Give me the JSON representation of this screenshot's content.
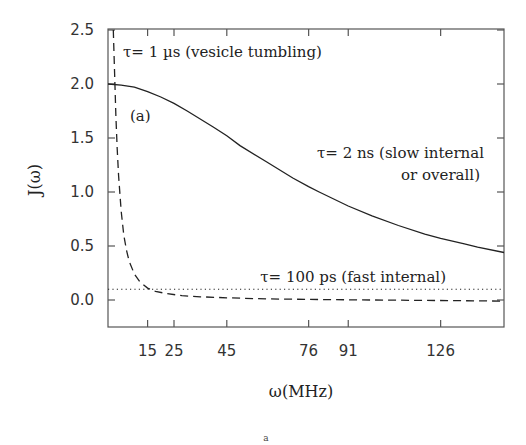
{
  "chart_data": {
    "type": "line",
    "title": "",
    "panel_label": "(a)",
    "caption": "a",
    "xlabel": "ω(MHz)",
    "ylabel": "J(ω)",
    "xlim": [
      0,
      150
    ],
    "ylim": [
      -0.25,
      2.5
    ],
    "grid": false,
    "x_ticks": [
      15,
      25,
      45,
      76,
      91,
      126
    ],
    "x_tick_labels": [
      "15",
      "25",
      "45",
      "76",
      "91",
      "126"
    ],
    "y_ticks": [
      0.0,
      0.5,
      1.0,
      1.5,
      2.0,
      2.5
    ],
    "y_tick_labels": [
      "0.0",
      "0.5",
      "1.0",
      "1.5",
      "2.0",
      "2.5"
    ],
    "series": [
      {
        "name": "τ= 2 ns (slow internal or overall)",
        "style": "solid",
        "x": [
          0,
          5,
          10,
          15,
          20,
          25,
          30,
          40,
          45,
          50,
          60,
          70,
          76,
          80,
          91,
          100,
          110,
          120,
          126,
          135,
          140,
          150
        ],
        "values": [
          2.0,
          1.99,
          1.97,
          1.93,
          1.88,
          1.82,
          1.75,
          1.6,
          1.52,
          1.43,
          1.28,
          1.13,
          1.05,
          1.0,
          0.87,
          0.78,
          0.69,
          0.61,
          0.57,
          0.52,
          0.49,
          0.44
        ]
      },
      {
        "name": "τ= 1 µs (vesicle tumbling)",
        "style": "dashed",
        "x": [
          2,
          2.5,
          3,
          3.5,
          4,
          5,
          6,
          7,
          8,
          10,
          12,
          15,
          18,
          22,
          28,
          35,
          45,
          60,
          80,
          100,
          125,
          150
        ],
        "values": [
          2.5,
          2.1,
          1.7,
          1.4,
          1.15,
          0.82,
          0.6,
          0.46,
          0.36,
          0.24,
          0.17,
          0.11,
          0.08,
          0.06,
          0.04,
          0.03,
          0.02,
          0.01,
          0.005,
          0.0,
          -0.005,
          -0.01
        ]
      },
      {
        "name": "τ= 100 ps (fast internal)",
        "style": "dotted",
        "x": [
          0,
          150
        ],
        "values": [
          0.1,
          0.1
        ]
      }
    ],
    "annotations": [
      {
        "text": "τ= 1 µs (vesicle tumbling)",
        "x": 4,
        "y": 2.3
      },
      {
        "text": "(a)",
        "x": 8,
        "y": 1.68
      },
      {
        "text": "τ= 2 ns (slow internal",
        "x": 147,
        "y": 1.12
      },
      {
        "text": "or overall)",
        "x": 147,
        "y": 0.92
      },
      {
        "text": "τ= 100 ps (fast internal)",
        "x": 147,
        "y": 0.17
      }
    ]
  }
}
